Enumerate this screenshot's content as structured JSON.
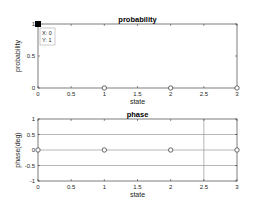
{
  "chart_data": [
    {
      "type": "scatter",
      "title": "probability",
      "xlabel": "state",
      "ylabel": "probability",
      "xlim": [
        0,
        3
      ],
      "ylim": [
        0,
        1
      ],
      "xticks": [
        "0",
        "0.5",
        "1",
        "1.5",
        "2",
        "2.5",
        "3"
      ],
      "yticks": [
        "0",
        "0.5",
        "1"
      ],
      "grid": false,
      "x": [
        0,
        1,
        2,
        3
      ],
      "values": [
        1,
        0,
        0,
        0
      ],
      "marker": "o",
      "data_tip": {
        "x_label": "X: 0",
        "y_label": "Y: 1",
        "x": 0,
        "y": 1
      }
    },
    {
      "type": "scatter",
      "title": "phase",
      "xlabel": "state",
      "ylabel": "phase(deg)",
      "xlim": [
        0,
        3
      ],
      "ylim": [
        -1,
        1
      ],
      "xticks": [
        "0",
        "0.5",
        "1",
        "1.5",
        "2",
        "2.5",
        "3"
      ],
      "yticks": [
        "-1",
        "-0.5",
        "0",
        "0.5",
        "1"
      ],
      "grid": true,
      "gridlines": {
        "y": [
          0.5,
          0,
          -0.5
        ],
        "x": [
          2.5
        ]
      },
      "x": [
        0,
        1,
        2,
        3
      ],
      "values": [
        0,
        0,
        0,
        0
      ],
      "marker": "o"
    }
  ],
  "colors": {
    "axis": "#262626",
    "grid": "#888888",
    "marker": "#444444",
    "datatip_marker": "#000000"
  }
}
